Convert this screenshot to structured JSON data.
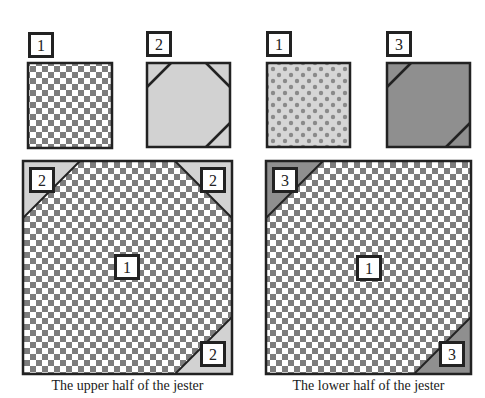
{
  "colors": {
    "border": "#222222",
    "checker_dark": "#7d7d7d",
    "checker_light": "#ffffff",
    "fabric2": "#d2d2d2",
    "fabric3": "#8f8f8f",
    "dots_bg": "#d6d6d6",
    "dots_dot": "#8a8a8a",
    "label_bg": "#ffffff"
  },
  "swatches": [
    {
      "id": "swatch-fabric-1-checker",
      "label": "1",
      "fill": "checker",
      "x": 28,
      "y": 63,
      "w": 84,
      "h": 85,
      "label_x": 28,
      "label_y": 32,
      "corners": []
    },
    {
      "id": "swatch-fabric-2",
      "label": "2",
      "fill": "fabric2",
      "x": 147,
      "y": 63,
      "w": 83,
      "h": 84,
      "label_x": 146,
      "label_y": 31,
      "corners": [
        "tl",
        "tr",
        "br"
      ],
      "corner_size": 24
    },
    {
      "id": "swatch-fabric-1-dots",
      "label": "1",
      "fill": "dots",
      "x": 267,
      "y": 63,
      "w": 83,
      "h": 84,
      "label_x": 266,
      "label_y": 31,
      "corners": []
    },
    {
      "id": "swatch-fabric-3",
      "label": "3",
      "fill": "fabric3",
      "x": 387,
      "y": 63,
      "w": 83,
      "h": 84,
      "label_x": 386,
      "label_y": 31,
      "corners": [
        "tl",
        "br"
      ],
      "corner_size": 24
    }
  ],
  "blocks": [
    {
      "id": "upper-half-block",
      "x": 23,
      "y": 161,
      "w": 209,
      "h": 213,
      "corner_fill": "fabric2",
      "corner_size": 57,
      "corners": [
        "tl",
        "tr",
        "br"
      ],
      "center_label": "1",
      "corner_labels": [
        {
          "text": "2",
          "x": 29,
          "y": 167
        },
        {
          "text": "2",
          "x": 200,
          "y": 167
        },
        {
          "text": "2",
          "x": 200,
          "y": 341
        }
      ],
      "center_label_pos": {
        "x": 114,
        "y": 254
      },
      "caption": "The upper half of the jester",
      "caption_x": 23,
      "caption_y": 378,
      "caption_w": 209
    },
    {
      "id": "lower-half-block",
      "x": 266,
      "y": 161,
      "w": 205,
      "h": 213,
      "corner_fill": "fabric3",
      "corner_size": 57,
      "corners": [
        "tl",
        "br"
      ],
      "center_label": "1",
      "corner_labels": [
        {
          "text": "3",
          "x": 272,
          "y": 167
        },
        {
          "text": "3",
          "x": 439,
          "y": 341
        }
      ],
      "center_label_pos": {
        "x": 356,
        "y": 255
      },
      "caption": "The lower half of the jester",
      "caption_x": 266,
      "caption_y": 378,
      "caption_w": 205
    }
  ],
  "captions": {
    "upper": "The upper half of the jester",
    "lower": "The lower half of the jester"
  }
}
